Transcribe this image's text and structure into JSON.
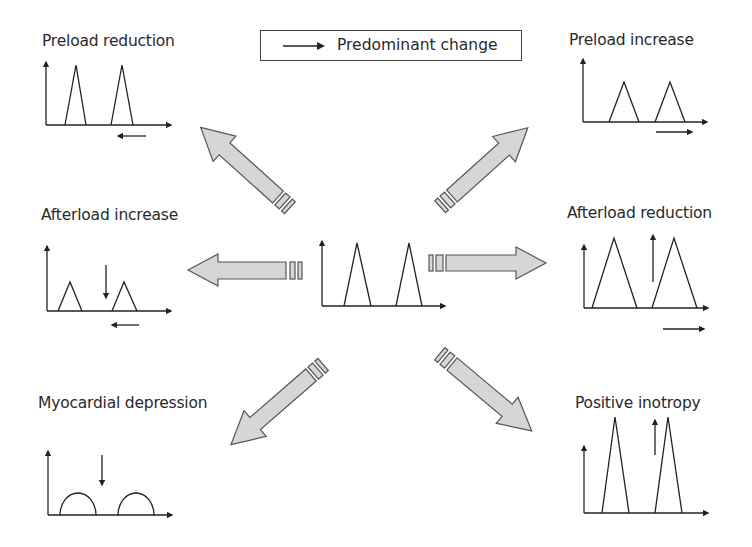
{
  "legend": {
    "label": "Predominant change",
    "icon": "arrow-right-icon"
  },
  "center": {
    "name": "Baseline",
    "peaks": "two triangles"
  },
  "panels": {
    "preload_reduction": {
      "title": "Preload reduction",
      "change_arrow": "left"
    },
    "preload_increase": {
      "title": "Preload increase",
      "change_arrow": "right"
    },
    "afterload_increase": {
      "title": "Afterload increase",
      "change_arrow": "left",
      "amplitude_arrow": "down"
    },
    "afterload_reduction": {
      "title": "Afterload reduction",
      "change_arrow": "right",
      "amplitude_arrow": "up"
    },
    "myocardial_depression": {
      "title": "Myocardial depression",
      "amplitude_arrow": "down"
    },
    "positive_inotropy": {
      "title": "Positive inotropy",
      "amplitude_arrow": "up"
    }
  },
  "edge_text": {
    "left_cut_glyph": "l"
  },
  "colors": {
    "big_arrow_fill": "#d6d6d6",
    "big_arrow_stroke": "#555555",
    "line": "#222222"
  }
}
